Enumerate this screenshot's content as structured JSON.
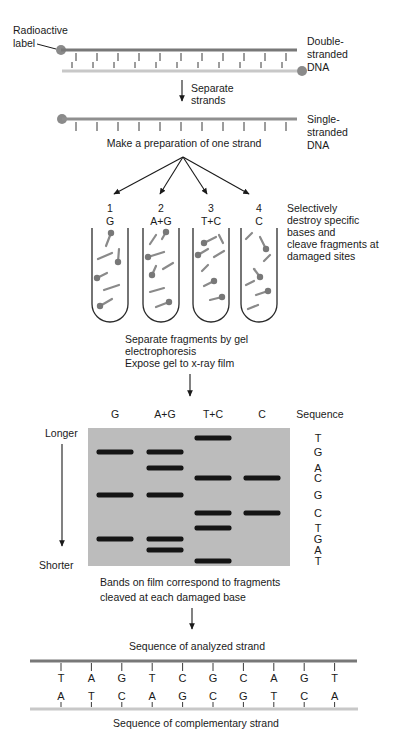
{
  "colors": {
    "text": "#1a1a1a",
    "strand_dark": "#787878",
    "strand_light": "#c8c8c8",
    "strand_single": "#8f8f8f",
    "label_dot": "#8a8a8a",
    "gel_bg": "#bcbcbc",
    "gel_border": "#2b2b2b",
    "band": "#151515",
    "tube_outline": "#2b2b2b",
    "fragment": "#8a8a8a",
    "fragment_dot": "#787878"
  },
  "header": {
    "radioactive_label": [
      "Radioactive",
      "label"
    ],
    "double_stranded_dna": [
      "Double-",
      "stranded",
      "DNA"
    ],
    "separate_strands": [
      "Separate",
      "strands"
    ],
    "single_stranded_dna": [
      "Single-",
      "stranded",
      "DNA"
    ],
    "make_preparation": "Make a preparation of one strand"
  },
  "cleavage": {
    "note": [
      "Selectively",
      "destroy specific",
      "bases and",
      "cleave fragments at",
      "damaged sites"
    ],
    "tubes": [
      {
        "number": "1",
        "label": "G",
        "fragments": [
          [
            14,
            18,
            19,
            5,
            2
          ],
          [
            6,
            31,
            20,
            25,
            0
          ],
          [
            27,
            21,
            26,
            34,
            2
          ],
          [
            5,
            50,
            15,
            45,
            1
          ],
          [
            12,
            62,
            27,
            57,
            0
          ],
          [
            8,
            78,
            20,
            71,
            1
          ]
        ]
      },
      {
        "number": "2",
        "label": "A+G",
        "fragments": [
          [
            7,
            16,
            13,
            7,
            0
          ],
          [
            19,
            11,
            23,
            4,
            2
          ],
          [
            5,
            29,
            21,
            24,
            1
          ],
          [
            9,
            47,
            13,
            38,
            1
          ],
          [
            20,
            41,
            30,
            35,
            0
          ],
          [
            7,
            64,
            21,
            60,
            0
          ],
          [
            13,
            79,
            26,
            74,
            2
          ]
        ]
      },
      {
        "number": "3",
        "label": "T+C",
        "fragments": [
          [
            11,
            15,
            23,
            9,
            1
          ],
          [
            26,
            7,
            30,
            15,
            0
          ],
          [
            5,
            27,
            15,
            21,
            1
          ],
          [
            21,
            29,
            31,
            23,
            0
          ],
          [
            9,
            43,
            15,
            37,
            0
          ],
          [
            11,
            58,
            21,
            53,
            2
          ],
          [
            17,
            72,
            29,
            69,
            2
          ]
        ]
      },
      {
        "number": "4",
        "label": "C",
        "fragments": [
          [
            5,
            11,
            11,
            5,
            0
          ],
          [
            19,
            9,
            25,
            21,
            2
          ],
          [
            23,
            33,
            29,
            27,
            0
          ],
          [
            13,
            41,
            19,
            49,
            2
          ],
          [
            5,
            57,
            13,
            53,
            0
          ],
          [
            15,
            67,
            27,
            63,
            2
          ],
          [
            7,
            81,
            17,
            77,
            0
          ]
        ]
      }
    ]
  },
  "electrophoresis_note": [
    "Separate fragments by gel",
    "electrophoresis",
    "Expose gel to x-ray film"
  ],
  "gel": {
    "lane_headers": [
      "G",
      "A+G",
      "T+C",
      "C"
    ],
    "sequence_header": "Sequence",
    "longer_label": "Longer",
    "shorter_label": "Shorter",
    "rows": [
      {
        "letter": "T",
        "lanes": [
          "T+C"
        ],
        "y": 438
      },
      {
        "letter": "G",
        "lanes": [
          "G",
          "A+G"
        ],
        "y": 452
      },
      {
        "letter": "A",
        "lanes": [
          "A+G"
        ],
        "y": 468
      },
      {
        "letter": "C",
        "lanes": [
          "T+C",
          "C"
        ],
        "y": 478
      },
      {
        "letter": "G",
        "lanes": [
          "G",
          "A+G"
        ],
        "y": 495
      },
      {
        "letter": "C",
        "lanes": [
          "T+C",
          "C"
        ],
        "y": 513
      },
      {
        "letter": "T",
        "lanes": [
          "T+C"
        ],
        "y": 528
      },
      {
        "letter": "G",
        "lanes": [
          "G",
          "A+G"
        ],
        "y": 539
      },
      {
        "letter": "A",
        "lanes": [
          "A+G"
        ],
        "y": 550
      },
      {
        "letter": "T",
        "lanes": [
          "T+C"
        ],
        "y": 561
      }
    ],
    "caption": [
      "Bands on film correspond to fragments",
      "cleaved at each damaged base"
    ]
  },
  "result": {
    "analyzed_title": "Sequence of analyzed strand",
    "analyzed_bases": [
      "T",
      "A",
      "G",
      "T",
      "C",
      "G",
      "C",
      "A",
      "G",
      "T"
    ],
    "complementary_bases": [
      "A",
      "T",
      "C",
      "A",
      "G",
      "C",
      "G",
      "T",
      "C",
      "A"
    ],
    "complementary_title": "Sequence of complementary strand"
  }
}
